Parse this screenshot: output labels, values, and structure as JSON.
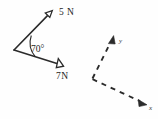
{
  "figure": {
    "background_color": "#fefefe",
    "ink_color": "#2b2b2b",
    "vectors": {
      "origin": {
        "x": 14,
        "y": 50
      },
      "items": [
        {
          "name": "force-5n",
          "label": "5 N",
          "magnitude": 5,
          "unit": "N",
          "tip": {
            "x": 51,
            "y": 12
          },
          "label_pos": {
            "x": 59,
            "y": 15
          },
          "arrowhead": "open"
        },
        {
          "name": "force-7n",
          "label": "7N",
          "magnitude": 7,
          "unit": "N",
          "tip": {
            "x": 62,
            "y": 65
          },
          "label_pos": {
            "x": 56,
            "y": 79
          },
          "arrowhead": "open"
        }
      ],
      "angle": {
        "label": "70°",
        "value": 70,
        "unit": "degrees",
        "label_pos": {
          "x": 31,
          "y": 52
        }
      }
    },
    "axes": {
      "name": "dashed-xy-axes",
      "style": "dashed",
      "vertex": {
        "x": 92,
        "y": 79
      },
      "items": [
        {
          "name": "axis-y",
          "label": "y",
          "tip": {
            "x": 113,
            "y": 37
          },
          "label_pos": {
            "x": 119,
            "y": 43
          },
          "arrowhead": "solid"
        },
        {
          "name": "axis-x",
          "label": "x",
          "tip": {
            "x": 146,
            "y": 104
          },
          "label_pos": {
            "x": 149,
            "y": 110
          },
          "arrowhead": "solid"
        }
      ]
    }
  }
}
